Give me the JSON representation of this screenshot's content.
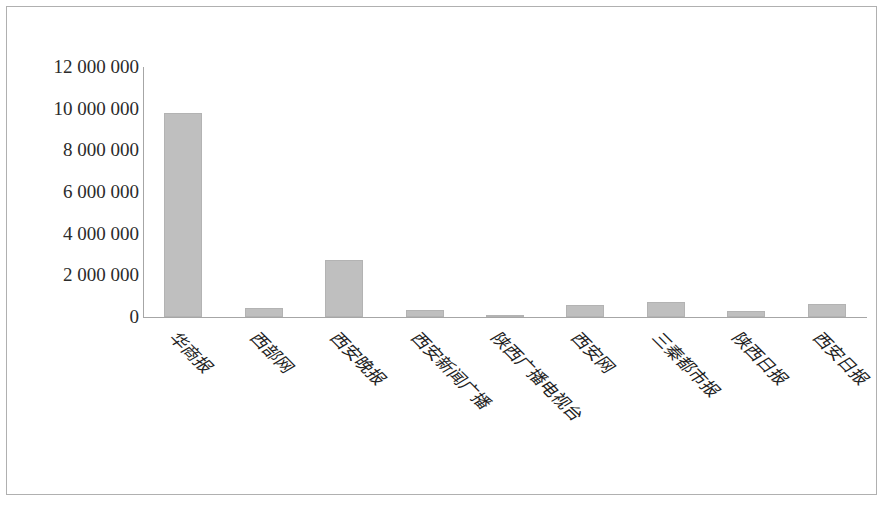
{
  "chart_data": {
    "type": "bar",
    "title": "",
    "subtitle": "",
    "xlabel": "",
    "ylabel": "",
    "grid": false,
    "legend": false,
    "legend_position": "none",
    "bar_color": "#bfbfbf",
    "bar_border_color": "#b3b3b3",
    "axis_color": "#a6a6a6",
    "frame_color": "#b0b0b0",
    "ylim": [
      0,
      12000000
    ],
    "ytick_labels": [
      "12 000 000",
      "10 000 000",
      "8 000 000",
      "6 000 000",
      "4 000 000",
      "2 000 000",
      "0"
    ],
    "ytick_values": [
      12000000,
      10000000,
      8000000,
      6000000,
      4000000,
      2000000,
      0
    ],
    "categories": [
      "华商报",
      "西部网",
      "西安晚报",
      "西安新闻广播",
      "陕西广播电视台",
      "西安网",
      "三秦都市报",
      "陕西日报",
      "西安日报"
    ],
    "values": [
      9800000,
      430000,
      2750000,
      320000,
      20000,
      580000,
      700000,
      280000,
      640000
    ]
  }
}
